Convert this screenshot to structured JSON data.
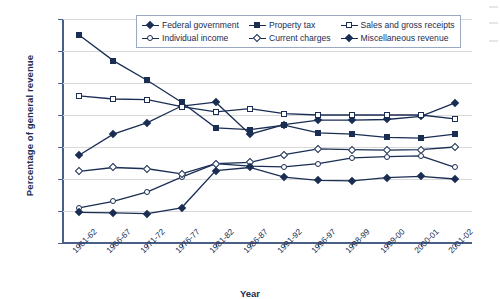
{
  "chart_data": {
    "type": "line",
    "title": "",
    "xlabel": "Year",
    "ylabel": "Percentage of general revenue",
    "ylim": [
      0,
      35
    ],
    "ytick_step": 5,
    "yticks": [
      0,
      5,
      10,
      15,
      20,
      25,
      30,
      35
    ],
    "grid": true,
    "legend_position": "top-center",
    "categories": [
      "1961-62",
      "1966-67",
      "1971-72",
      "1976-77",
      "1981-82",
      "1986-87",
      "1991-92",
      "1996-97",
      "1998-99",
      "1999-00",
      "2000-01",
      "2001-02"
    ],
    "series": [
      {
        "name": "Federal government",
        "marker": "filled-diamond",
        "color": "#1a2d53",
        "values": [
          13.7,
          17.0,
          18.8,
          21.4,
          22.0,
          17.0,
          18.5,
          19.2,
          19.2,
          19.3,
          19.8,
          21.9
        ]
      },
      {
        "name": "Property tax",
        "marker": "filled-square",
        "color": "#1a2d53",
        "values": [
          32.5,
          28.5,
          25.4,
          22.0,
          18.0,
          17.7,
          18.4,
          17.2,
          17.0,
          16.5,
          16.4,
          17.0
        ]
      },
      {
        "name": "Sales and gross receipts",
        "marker": "open-square",
        "color": "#1a2d53",
        "values": [
          23.0,
          22.5,
          22.4,
          21.3,
          20.5,
          21.0,
          20.2,
          20.0,
          20.0,
          20.0,
          20.0,
          19.4
        ]
      },
      {
        "name": "Individual income",
        "marker": "open-circle",
        "color": "#1a2d53",
        "values": [
          5.5,
          6.5,
          8.0,
          10.3,
          12.4,
          12.0,
          11.9,
          12.4,
          13.3,
          13.5,
          13.6,
          11.8
        ]
      },
      {
        "name": "Current charges",
        "marker": "open-diamond",
        "color": "#1a2d53",
        "values": [
          11.2,
          11.8,
          11.6,
          10.8,
          12.4,
          12.6,
          13.8,
          14.7,
          14.6,
          14.5,
          14.6,
          15.0
        ]
      },
      {
        "name": "Miscellaneous revenue",
        "marker": "filled-diamond",
        "color": "#1a2d53",
        "values": [
          4.8,
          4.7,
          4.6,
          5.5,
          11.3,
          11.8,
          10.3,
          9.8,
          9.7,
          10.2,
          10.4,
          10.0
        ]
      }
    ]
  },
  "axis": {
    "y_title": "Percentage of general revenue",
    "x_title": "Year"
  },
  "legend": {
    "items": [
      {
        "label": "Federal government",
        "marker": "filled-diamond"
      },
      {
        "label": "Property tax",
        "marker": "filled-square"
      },
      {
        "label": "Sales and gross receipts",
        "marker": "open-square"
      },
      {
        "label": "Individual income",
        "marker": "open-circle"
      },
      {
        "label": "Current charges",
        "marker": "open-diamond"
      },
      {
        "label": "Miscellaneous revenue",
        "marker": "filled-diamond"
      }
    ]
  },
  "colors": {
    "series": "#1a2d53",
    "grid": "#d8d8d8",
    "axis": "#4a5f85",
    "text": "#1a2d53",
    "background": "#ffffff"
  }
}
